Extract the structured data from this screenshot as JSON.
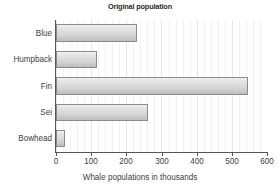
{
  "chart_data": {
    "type": "bar",
    "orientation": "horizontal",
    "title": "Original population",
    "xlabel": "Whale populations in thousands",
    "ylabel": "",
    "categories": [
      "Blue",
      "Humpback",
      "Fin",
      "Sei",
      "Bowhead"
    ],
    "values": [
      229,
      116,
      547,
      261,
      26
    ],
    "xlim": [
      0,
      600
    ],
    "xticks": [
      0,
      100,
      200,
      300,
      400,
      500,
      600
    ],
    "xtick_labels": [
      "0",
      "100",
      "200",
      "300",
      "400",
      "500",
      "600"
    ],
    "grid": "vertical-minor-and-major",
    "legend": null,
    "colors": {
      "bar_fill_light": "#efefef",
      "bar_fill_dark": "#bdbdbd",
      "bar_border": "#8b8b8b",
      "axis": "#555555",
      "grid_minor": "#f2f2f2",
      "grid_major": "#e6e6e6",
      "text": "#3d3d3d",
      "title_text": "#2b2b2b",
      "background": "#ffffff"
    }
  }
}
